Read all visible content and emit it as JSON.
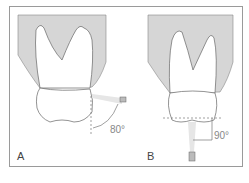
{
  "figure": {
    "panels": [
      {
        "label": "A",
        "angle": "80°",
        "description": "X-ray beam at 80° to tooth axis (lateral)"
      },
      {
        "label": "B",
        "angle": "90°",
        "description": "X-ray beam at 90° to occlusal plane (from below)"
      }
    ],
    "colors": {
      "bone": "#d6d6d6",
      "outline": "#666666",
      "frame": "#9a9a9a",
      "text": "#444444"
    }
  }
}
